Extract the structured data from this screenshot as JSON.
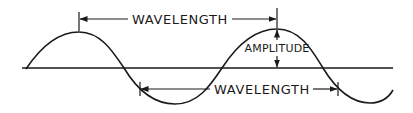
{
  "diagram": {
    "type": "sine-wave-annotation",
    "labels": {
      "top_wavelength": "WAVELENGTH",
      "amplitude": "AMPLITUDE",
      "bottom_wavelength": "WAVELENGTH"
    },
    "colors": {
      "line": "#1a1a1a",
      "background": "#ffffff"
    }
  }
}
